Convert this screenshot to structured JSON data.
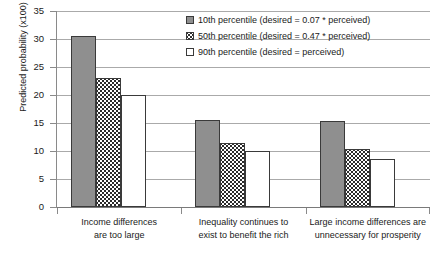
{
  "chart_data": {
    "type": "bar",
    "title": "",
    "subtitle": "",
    "xlabel": "",
    "ylabel": "Predicted probability (x100)",
    "ylim": [
      0,
      35
    ],
    "ytick_step": 5,
    "yticks": [
      "35",
      "30",
      "25",
      "20",
      "15",
      "10",
      "5",
      "0"
    ],
    "grid": "horizontal",
    "legend_position": "top-right",
    "categories": [
      "Income differences\nare too large",
      "Inequality continues to\nexist to benefit the rich",
      "Large income differences are\nunnecessary for prosperity"
    ],
    "category_lines": [
      [
        "Income differences",
        "are too large"
      ],
      [
        "Inequality continues to",
        "exist to benefit the rich"
      ],
      [
        "Large income differences are",
        "unnecessary for prosperity"
      ]
    ],
    "series": [
      {
        "name": "10th percentile (desired = 0.07 * perceived)",
        "key": "p10",
        "style": "solid-gray",
        "color": "#8f8f8f",
        "values": [
          30.5,
          15.5,
          15.3
        ]
      },
      {
        "name": "50th percentile (desired = 0.47 * perceived)",
        "key": "p50",
        "style": "dotted-pattern",
        "color": "#ffffff",
        "values": [
          23.0,
          11.5,
          10.3
        ]
      },
      {
        "name": "90th percentile (desired = perceived)",
        "key": "p90",
        "style": "open-white",
        "color": "#ffffff",
        "values": [
          20.0,
          10.0,
          8.5
        ]
      }
    ]
  },
  "legend": {
    "items": [
      {
        "label": "10th percentile (desired = 0.07 * perceived)",
        "key": "p10"
      },
      {
        "label": "50th percentile (desired = 0.47 * perceived)",
        "key": "p50"
      },
      {
        "label": "90th percentile (desired = perceived)",
        "key": "p90"
      }
    ]
  },
  "axes": {
    "y_title": "Predicted probability (x100)",
    "y_labels": [
      "35",
      "30",
      "25",
      "20",
      "15",
      "10",
      "5",
      "0"
    ]
  }
}
